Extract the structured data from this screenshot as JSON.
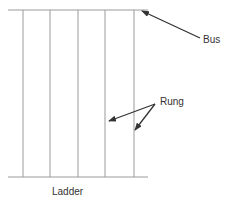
{
  "diagram": {
    "title": "Ladder",
    "labels": {
      "bus": "Bus",
      "rung": "Rung",
      "ladder": "Ladder"
    },
    "colors": {
      "line": "#9a9a9a",
      "arrow": "#333333",
      "text": "#333333",
      "background": "#ffffff"
    },
    "buses": [
      {
        "name": "top-bus",
        "x1": 8,
        "y1": 10,
        "x2": 148,
        "y2": 10
      },
      {
        "name": "bottom-bus",
        "x1": 8,
        "y1": 177,
        "x2": 148,
        "y2": 177
      }
    ],
    "rungs_x": [
      23,
      50,
      78,
      105,
      134
    ],
    "arrows": [
      {
        "name": "bus-arrow",
        "from": [
          200,
          38
        ],
        "to": [
          142,
          11
        ]
      },
      {
        "name": "rung-arrow-1",
        "from": [
          155,
          104
        ],
        "to": [
          109,
          121
        ]
      },
      {
        "name": "rung-arrow-2",
        "from": [
          155,
          104
        ],
        "to": [
          135,
          130
        ]
      }
    ]
  }
}
